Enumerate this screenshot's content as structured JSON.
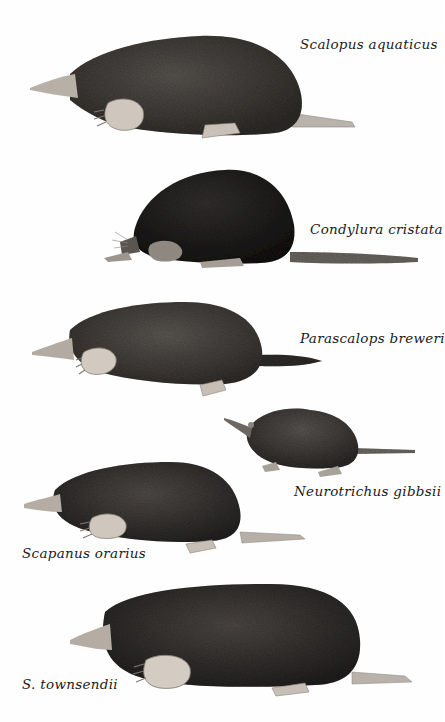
{
  "plate": {
    "background": "#fefefe",
    "species": [
      {
        "id": "scalopus-aquaticus",
        "label": "Scalopus aquaticus",
        "label_pos": {
          "x": 300,
          "y": 38
        },
        "fur": "#3a3632",
        "fur_light": "#6e6862"
      },
      {
        "id": "condylura-cristata",
        "label": "Condylura cristata",
        "label_pos": {
          "x": 310,
          "y": 223
        },
        "fur": "#1e1c1b",
        "fur_light": "#4a4643"
      },
      {
        "id": "parascalops-breweri",
        "label": "Parascalops breweri",
        "label_pos": {
          "x": 300,
          "y": 332
        },
        "fur": "#3c3835",
        "fur_light": "#75706a"
      },
      {
        "id": "neurotrichus-gibbsii",
        "label": "Neurotrichus gibbsii",
        "label_pos": {
          "x": 294,
          "y": 485
        },
        "fur": "#3a3633",
        "fur_light": "#6f6a66"
      },
      {
        "id": "scapanus-orarius",
        "label": "Scapanus orarius",
        "label_pos": {
          "x": 22,
          "y": 547
        },
        "fur": "#2f2c2a",
        "fur_light": "#66615c"
      },
      {
        "id": "s-townsendii",
        "label": "S. townsendii",
        "label_pos": {
          "x": 22,
          "y": 678
        },
        "fur": "#2b2826",
        "fur_light": "#625d58"
      }
    ]
  }
}
